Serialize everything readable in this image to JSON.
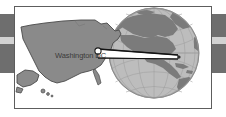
{
  "figure": {
    "title_text": "",
    "callout_label": "Washington DC",
    "colors": {
      "panel_background": "#ffffff",
      "panel_border": "#5d5d5d",
      "stripe_dark": "#6e6e6e",
      "stripe_light": "#d2d2d2",
      "map_land": "#8a8a8a",
      "map_outline": "#4a4a4a",
      "globe_ocean": "#bdbdbd",
      "globe_land": "#7b7b7b",
      "globe_grid": "#9a9a9a",
      "globe_edge": "#6f6f6f",
      "pointer": "#1c1c1c",
      "marker_fill": "#ffffff",
      "label_text": "#3a3a3a"
    },
    "elements": {
      "us_map_name": "united-states-map",
      "alaska_name": "alaska-inset",
      "hawaii_name": "hawaii-inset",
      "globe_name": "globe-north-america",
      "pointer_name": "pointer-wedge",
      "marker_name": "washington-dc-marker"
    },
    "globe": {
      "center_x": 153,
      "center_y": 52,
      "radius": 45,
      "meridian_count": 7,
      "parallel_count": 7,
      "continents_visible": "North America, Central America, northern South America, Greenland"
    },
    "marker": {
      "map_x": 96,
      "map_y": 50,
      "globe_x": 176,
      "globe_y": 56
    }
  }
}
